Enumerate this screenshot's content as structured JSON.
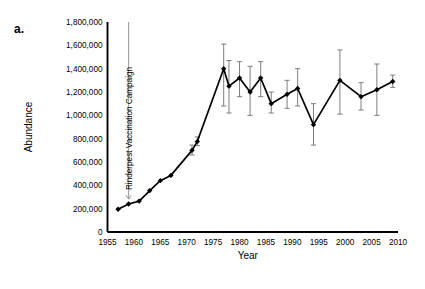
{
  "panel": {
    "label": "a."
  },
  "chart_data": {
    "type": "line",
    "title": "",
    "xlabel": "Year",
    "ylabel": "Abundance",
    "xlim": [
      1955,
      2010
    ],
    "ylim": [
      0,
      1800000
    ],
    "xticks": [
      1955,
      1960,
      1965,
      1970,
      1975,
      1980,
      1985,
      1990,
      1995,
      2000,
      2005,
      2010
    ],
    "xtick_labels": [
      "1955",
      "1960",
      "1965",
      "1970",
      "1975",
      "1980",
      "1985",
      "1990",
      "1995",
      "2000",
      "2005",
      "2010"
    ],
    "yticks": [
      0,
      200000,
      400000,
      600000,
      800000,
      1000000,
      1200000,
      1400000,
      1600000,
      1800000
    ],
    "ytick_labels": [
      "0",
      "200,000",
      "400,000",
      "600,000",
      "800,000",
      "1,000,000",
      "1,200,000",
      "1,400,000",
      "1,600,000",
      "1,800,000"
    ],
    "grid": false,
    "legend": false,
    "marker": "diamond",
    "series": [
      {
        "name": "Wildebeest abundance",
        "x": [
          1957,
          1959,
          1961,
          1963,
          1965,
          1967,
          1971,
          1972,
          1977,
          1978,
          1980,
          1982,
          1984,
          1986,
          1989,
          1991,
          1994,
          1999,
          2003,
          2006,
          2009
        ],
        "values": [
          195000,
          240000,
          265000,
          355000,
          440000,
          485000,
          700000,
          775000,
          1400000,
          1250000,
          1320000,
          1200000,
          1320000,
          1100000,
          1180000,
          1230000,
          920000,
          1300000,
          1160000,
          1220000,
          1290000
        ],
        "err_low": [
          null,
          null,
          null,
          null,
          null,
          null,
          660000,
          740000,
          1080000,
          1020000,
          1160000,
          1000000,
          1160000,
          1020000,
          1060000,
          1080000,
          745000,
          1010000,
          1045000,
          1000000,
          1240000
        ],
        "err_high": [
          null,
          null,
          null,
          null,
          null,
          null,
          745000,
          815000,
          1610000,
          1470000,
          1460000,
          1420000,
          1460000,
          1200000,
          1300000,
          1400000,
          1100000,
          1560000,
          1280000,
          1440000,
          1345000
        ]
      }
    ],
    "annotations": [
      {
        "text": "Rinderpest Vaccination Campaign",
        "x": 1959,
        "arrow_from_y": 1800000,
        "arrow_to_y": 265000,
        "orientation": "vertical"
      }
    ]
  }
}
